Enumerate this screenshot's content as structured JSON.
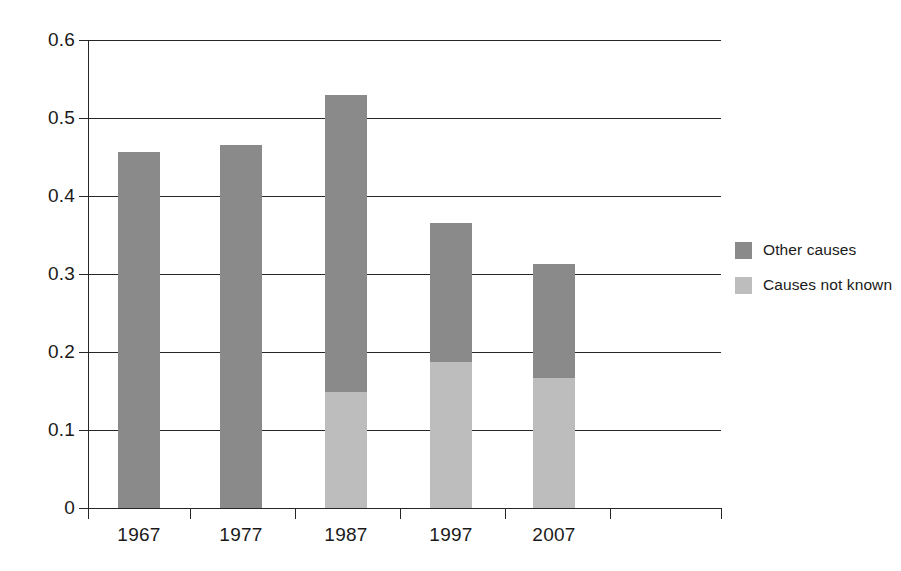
{
  "chart_data": {
    "type": "bar",
    "subtype": "stacked-vertical",
    "title": "",
    "subtitle": "",
    "xlabel": "",
    "ylabel": "",
    "categories": [
      "1967",
      "1977",
      "1987",
      "1997",
      "2007"
    ],
    "series": [
      {
        "name": "Causes not known",
        "color": "#bdbdbd",
        "values": [
          0,
          0,
          0.149,
          0.187,
          0.167
        ]
      },
      {
        "name": "Other causes",
        "color": "#8a8a8a",
        "values": [
          0.456,
          0.465,
          0.381,
          0.179,
          0.146
        ]
      }
    ],
    "totals": [
      0.456,
      0.465,
      0.53,
      0.366,
      0.313
    ],
    "ylim": [
      0,
      0.6
    ],
    "yticks": [
      0,
      0.1,
      0.2,
      0.3,
      0.4,
      0.5,
      0.6
    ],
    "ytick_labels": [
      "0",
      "0.1",
      "0.2",
      "0.3",
      "0.4",
      "0.5",
      "0.6"
    ],
    "grid": true,
    "grid_axis": "y",
    "legend_position": "right",
    "legend_entries": [
      "Other causes",
      "Causes not known"
    ],
    "annotations": []
  },
  "legend": {
    "items": [
      {
        "label": "Other causes",
        "color": "#8a8a8a"
      },
      {
        "label": "Causes not known",
        "color": "#bdbdbd"
      }
    ]
  },
  "axes": {
    "y": {
      "labels": [
        "0.6",
        "0.5",
        "0.4",
        "0.3",
        "0.2",
        "0.1",
        "0"
      ],
      "values": [
        0.6,
        0.5,
        0.4,
        0.3,
        0.2,
        0.1,
        0
      ]
    },
    "x": {
      "labels": [
        "1967",
        "1977",
        "1987",
        "1997",
        "2007"
      ]
    }
  }
}
